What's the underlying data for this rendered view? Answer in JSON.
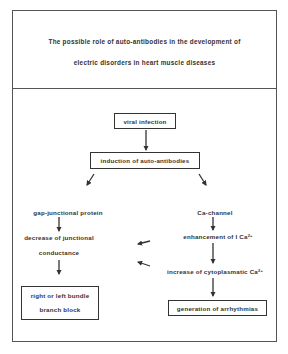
{
  "title": {
    "line1": "The possible role of auto-antibodies in the development of",
    "line2": "electric disorders in heart muscle diseases"
  },
  "nodes": {
    "viral_infection": "viral infection",
    "induction": "induction of auto-antibodies",
    "gap_protein": "gap-junctional protein",
    "ca_channel": "Ca-channel",
    "decrease_line1": "decrease of junctional",
    "decrease_line2": "conductance",
    "enhancement": "enhancement of I Ca",
    "enhancement_sup": "2+",
    "increase": "increase of cytoplasmatic Ca",
    "increase_sup": "2+",
    "bundle_line1": "right or left bundle",
    "bundle_line2": "branch block",
    "arrhythmias": "generation of arrhythmias"
  },
  "colors": {
    "line": "#333333",
    "border": "#555555",
    "background": "#ffffff"
  }
}
